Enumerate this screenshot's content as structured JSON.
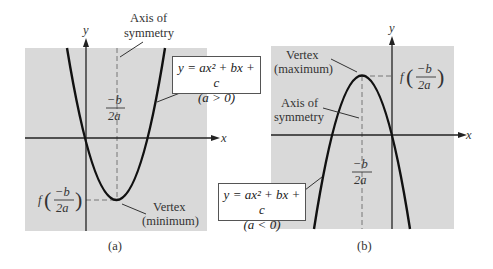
{
  "panels": [
    {
      "id": "a",
      "caption": "(a)",
      "axis_labels": {
        "x": "x",
        "y": "y"
      },
      "equation": "y = ax² + bx + c",
      "condition": "(a > 0)",
      "axis_of_symmetry_label": [
        "Axis of",
        "symmetry"
      ],
      "vertex_label": [
        "Vertex",
        "(minimum)"
      ],
      "vertex_x_label": {
        "num": "−b",
        "den": "2a"
      },
      "vertex_y_label": {
        "f": "f",
        "num": "−b",
        "den": "2a"
      },
      "opens": "upward"
    },
    {
      "id": "b",
      "caption": "(b)",
      "axis_labels": {
        "x": "x",
        "y": "y"
      },
      "equation": "y = ax² + bx + c",
      "condition": "(a < 0)",
      "axis_of_symmetry_label": [
        "Axis of",
        "symmetry"
      ],
      "vertex_label": [
        "Vertex",
        "(maximum)"
      ],
      "vertex_x_label": {
        "num": "−b",
        "den": "2a"
      },
      "vertex_y_label": {
        "f": "f",
        "num": "−b",
        "den": "2a"
      },
      "opens": "downward"
    }
  ],
  "colors": {
    "panel_bg": "#d9d9d9",
    "curve": "#111111",
    "axis": "#222222",
    "dashed": "#777777"
  }
}
